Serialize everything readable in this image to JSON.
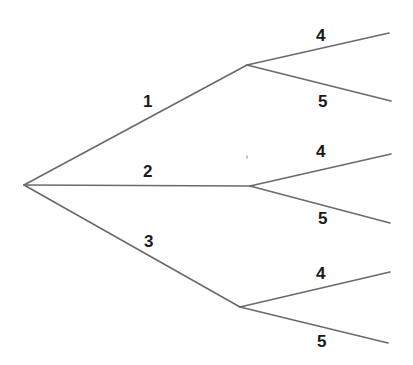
{
  "diagram": {
    "type": "tree",
    "colors": {
      "edge": "#6a6a6a",
      "label": "#1a1a1a",
      "background": "#ffffff"
    },
    "nodes": {
      "root": {
        "x": 24,
        "y": 185
      },
      "n1": {
        "x": 247,
        "y": 65
      },
      "n2": {
        "x": 250,
        "y": 186
      },
      "n3": {
        "x": 240,
        "y": 307
      },
      "l14": {
        "x": 389,
        "y": 33
      },
      "l15": {
        "x": 391,
        "y": 101
      },
      "l24": {
        "x": 391,
        "y": 154
      },
      "l25": {
        "x": 390,
        "y": 223
      },
      "l34": {
        "x": 390,
        "y": 272
      },
      "l35": {
        "x": 388,
        "y": 343
      }
    },
    "first_level": [
      {
        "label": "1",
        "from": "root",
        "to": "n1"
      },
      {
        "label": "2",
        "from": "root",
        "to": "n2"
      },
      {
        "label": "3",
        "from": "root",
        "to": "n3"
      }
    ],
    "second_level": [
      {
        "parent": "1",
        "branches": [
          {
            "label": "4"
          },
          {
            "label": "5"
          }
        ]
      },
      {
        "parent": "2",
        "branches": [
          {
            "label": "4"
          },
          {
            "label": "5"
          }
        ]
      },
      {
        "parent": "3",
        "branches": [
          {
            "label": "4"
          },
          {
            "label": "5"
          }
        ]
      }
    ]
  }
}
